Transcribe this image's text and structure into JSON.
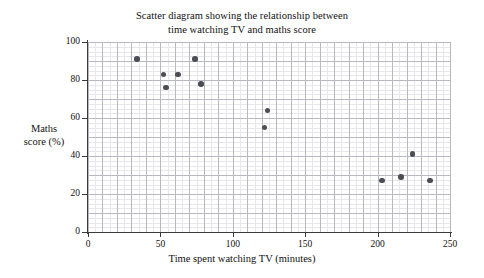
{
  "chart_data": {
    "type": "scatter",
    "title": "Scatter diagram showing the relationship between time watching TV and maths score",
    "title_lines": [
      "Scatter diagram showing the relationship between",
      "time watching TV and maths score"
    ],
    "xlabel": "Time spent watching TV (minutes)",
    "ylabel": "Maths score (%)",
    "ylabel_lines": [
      "Maths",
      "score (%)"
    ],
    "xlim": [
      0,
      250
    ],
    "ylim": [
      0,
      100
    ],
    "xticks": [
      0,
      50,
      100,
      150,
      200,
      250
    ],
    "yticks": [
      0,
      20,
      40,
      60,
      80,
      100
    ],
    "xtick_labels": [
      "0",
      "50",
      "100",
      "150",
      "200",
      "250"
    ],
    "ytick_labels": [
      "0",
      "20",
      "40",
      "60",
      "80",
      "100"
    ],
    "x_minor_step": 5,
    "y_minor_step": 2.5,
    "x_major_step": 10,
    "y_major_step": 10,
    "grid": true,
    "legend": null,
    "series": [
      {
        "name": "students",
        "marker": "circle",
        "color": "#4d4d55",
        "points": [
          {
            "x": 34,
            "y": 91
          },
          {
            "x": 52,
            "y": 83
          },
          {
            "x": 62,
            "y": 83
          },
          {
            "x": 54,
            "y": 76
          },
          {
            "x": 74,
            "y": 91
          },
          {
            "x": 78,
            "y": 78
          },
          {
            "x": 124,
            "y": 64
          },
          {
            "x": 122,
            "y": 55
          },
          {
            "x": 203,
            "y": 27
          },
          {
            "x": 216,
            "y": 29
          },
          {
            "x": 224,
            "y": 41
          },
          {
            "x": 236,
            "y": 27
          }
        ]
      }
    ]
  },
  "colors": {
    "marker": "#4d4d55",
    "axis": "#3a3a3a",
    "grid_minor": "#e3e3e8",
    "grid_major": "#b9b9c2",
    "background": "#ffffff",
    "text": "#111111"
  }
}
